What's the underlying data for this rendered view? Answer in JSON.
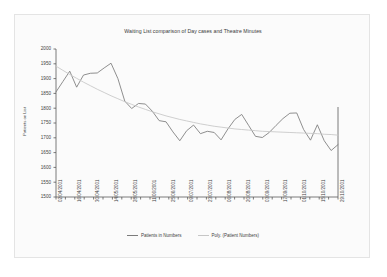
{
  "chart_data": {
    "type": "line",
    "title": "Waiting List comparison of Day cases and Theatre Minutes",
    "xlabel": "",
    "ylabel": "Patients on List",
    "ylim": [
      1500,
      2000
    ],
    "ytick_step": 50,
    "yticks": [
      2000,
      1950,
      1900,
      1850,
      1800,
      1750,
      1700,
      1650,
      1600,
      1550,
      1500
    ],
    "grid": false,
    "legend_position": "bottom",
    "legend": [
      "Patients in Numbers",
      "Poly. (Patient Numbers)"
    ],
    "colors": {
      "series_patients": "#7b7b7b",
      "series_poly": "#c6c6c6",
      "axis": "#5a5a5a",
      "text": "#3f3f3f",
      "plot_background": "#fbfbfb",
      "frame_border": "#e4e4e4"
    },
    "x_tick_labels": [
      "02/04/2001",
      "16/04/2001",
      "30/04/2001",
      "14/05/2001",
      "28/05/2001",
      "11/06/2001",
      "25/06/2001",
      "09/07/2001",
      "23/07/2001",
      "06/08/2001",
      "20/08/2001",
      "03/09/2001",
      "17/09/2001",
      "01/10/2001",
      "15/10/2001",
      "29/10/2001"
    ],
    "x_labels_every_nth_tick": 2,
    "total_x_ticks": 31,
    "series": [
      {
        "name": "Patients in Numbers",
        "color": "#7b7b7b",
        "values": [
          1855,
          1890,
          1925,
          1871,
          1912,
          1918,
          1919,
          1936,
          1952,
          1900,
          1824,
          1799,
          1816,
          1814,
          1790,
          1758,
          1754,
          1720,
          1690,
          1724,
          1743,
          1714,
          1722,
          1718,
          1693,
          1730,
          1762,
          1779,
          1742,
          1705,
          1701,
          1718,
          1742,
          1765,
          1783,
          1784,
          1728,
          1692,
          1744,
          1690,
          1657,
          1677
        ]
      },
      {
        "name": "Poly. (Patient Numbers)",
        "color": "#c6c6c6",
        "values": [
          1942,
          1928,
          1914,
          1901,
          1888,
          1876,
          1864,
          1853,
          1842,
          1832,
          1822,
          1813,
          1804,
          1796,
          1788,
          1781,
          1774,
          1768,
          1762,
          1757,
          1752,
          1747,
          1743,
          1739,
          1736,
          1733,
          1730,
          1728,
          1726,
          1724,
          1722,
          1721,
          1720,
          1719,
          1718,
          1717,
          1716,
          1715,
          1714,
          1712,
          1711,
          1709
        ]
      }
    ],
    "secondary_axis_line": true
  }
}
